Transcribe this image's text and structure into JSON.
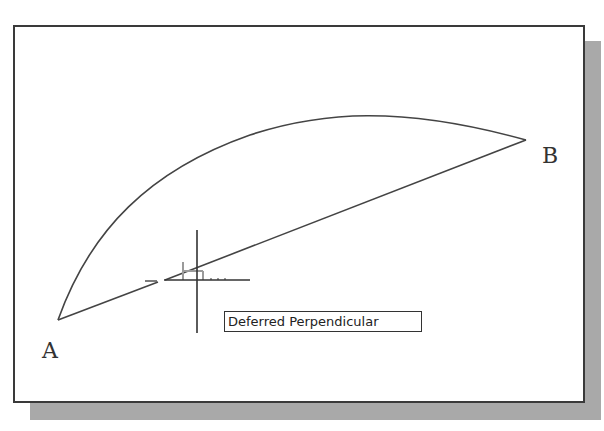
{
  "canvas": {
    "background": "#ffffff",
    "border_color": "#3a3a3a",
    "shadow_color": "#a9a9a9"
  },
  "points": {
    "a": {
      "label": "A",
      "x": 58,
      "y": 320
    },
    "b": {
      "label": "B",
      "x": 526,
      "y": 140
    }
  },
  "cursor": {
    "type": "crosshair",
    "x": 197,
    "y": 280
  },
  "snap_marker": {
    "type": "perpendicular",
    "color": "#9a9a9a"
  },
  "tooltip": {
    "text": "Deferred Perpendicular"
  }
}
